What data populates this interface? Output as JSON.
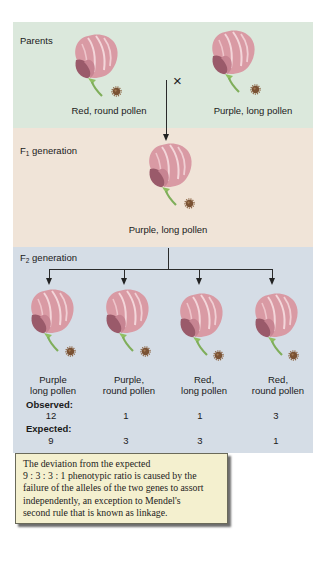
{
  "parents": {
    "label": "Parents",
    "cross_symbol": "×",
    "left": {
      "label": "Red, round pollen",
      "flower_color": "red",
      "pollen_shape": "round"
    },
    "right": {
      "label": "Purple, long pollen",
      "flower_color": "purple",
      "pollen_shape": "long"
    }
  },
  "f1": {
    "label_prefix": "F",
    "label_sub": "1",
    "label_suffix": " generation",
    "offspring": {
      "label": "Purple, long pollen"
    }
  },
  "f2": {
    "label_prefix": "F",
    "label_sub": "2",
    "label_suffix": " generation",
    "phenotypes": [
      {
        "line1": "Purple",
        "line2": "long pollen",
        "observed": "12",
        "expected": "9"
      },
      {
        "line1": "Purple,",
        "line2": "round pollen",
        "observed": "1",
        "expected": "3"
      },
      {
        "line1": "Red,",
        "line2": "long pollen",
        "observed": "1",
        "expected": "3"
      },
      {
        "line1": "Red,",
        "line2": "round pollen",
        "observed": "3",
        "expected": "1"
      }
    ],
    "observed_label": "Observed:",
    "expected_label": "Expected:"
  },
  "note": {
    "lines": [
      "The deviation from the expected",
      "9 : 3 : 3 : 1 phenotypic ratio is caused by the",
      "failure of the alleles of the two genes to assort",
      "independently, an exception to Mendel's",
      "second rule that is known as linkage."
    ]
  },
  "colors": {
    "parents_bg": "#dbe8dc",
    "f1_bg": "#f0e4d8",
    "f2_bg": "#d5dde6",
    "note_bg": "#f4f0cf",
    "petal": "#d99aa4",
    "stem": "#7fae5a",
    "pollen": "#7a5234"
  }
}
